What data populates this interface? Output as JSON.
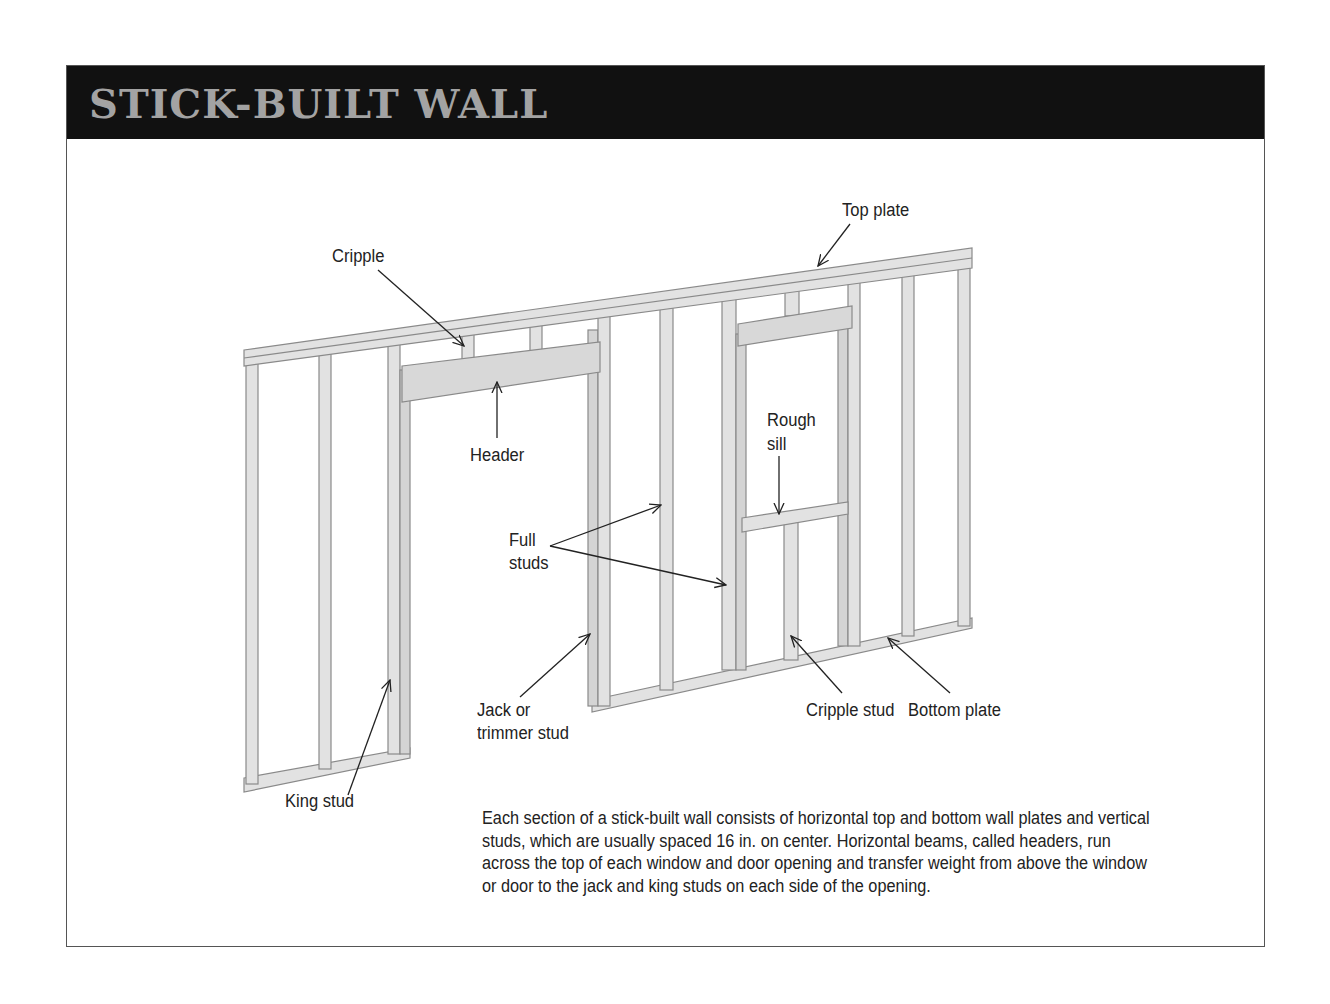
{
  "header": {
    "title": "STICK-BUILT WALL"
  },
  "labels": {
    "top_plate": "Top plate",
    "cripple": "Cripple",
    "header": "Header",
    "rough_sill_line1": "Rough",
    "rough_sill_line2": "sill",
    "full_studs_line1": "Full",
    "full_studs_line2": "studs",
    "jack_stud_line1": "Jack or",
    "jack_stud_line2": "trimmer stud",
    "cripple_stud": "Cripple stud",
    "bottom_plate": "Bottom plate",
    "king_stud": "King stud"
  },
  "caption": "Each section of a stick-built wall consists of horizontal top and bottom wall plates and vertical studs, which are usually spaced 16 in. on center. Horizontal beams, called headers, run across the top of each window and door opening and transfer weight from above the window or door to the jack and king studs on each side of the opening.",
  "colors": {
    "header_bg": "#111111",
    "title": "#a3a3a3",
    "lumber": "#e2e2e2",
    "lumber_shade": "#c9c9c9",
    "lumber_edge": "#8a8a8a"
  }
}
